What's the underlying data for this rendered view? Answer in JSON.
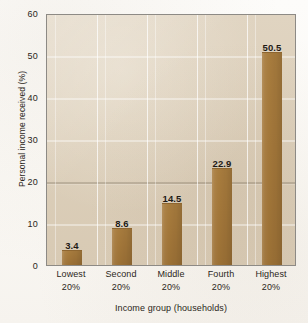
{
  "chart_data": {
    "type": "bar",
    "title": "",
    "subtitle": "",
    "xlabel": "Income group (households)",
    "ylabel": "Personal income received (%)",
    "categories": [
      "Lowest 20%",
      "Second 20%",
      "Middle 20%",
      "Fourth 20%",
      "Highest 20%"
    ],
    "category_lines": [
      {
        "line1": "Lowest",
        "line2": "20%"
      },
      {
        "line1": "Second",
        "line2": "20%"
      },
      {
        "line1": "Middle",
        "line2": "20%"
      },
      {
        "line1": "Fourth",
        "line2": "20%"
      },
      {
        "line1": "Highest",
        "line2": "20%"
      }
    ],
    "values": [
      3.4,
      8.6,
      14.5,
      22.9,
      50.5
    ],
    "value_labels": [
      "3.4",
      "8.6",
      "14.5",
      "22.9",
      "50.5"
    ],
    "ylim": [
      0,
      60
    ],
    "yticks": [
      0,
      10,
      20,
      30,
      40,
      50,
      60
    ],
    "ytick_labels": [
      "0",
      "10",
      "20",
      "30",
      "40",
      "50",
      "60"
    ],
    "grid": true,
    "grid_orientation": "both",
    "legend": "none",
    "colors": {
      "bar": "#a3773a",
      "bar_edge": "#8e6630",
      "plot_background": "#dccfba",
      "gridline": "#ffffff",
      "crease_line": "#6c5e4c",
      "axis_border": "#8d8a85",
      "text": "#2b2620",
      "page_background": "#fdfcfa"
    }
  }
}
